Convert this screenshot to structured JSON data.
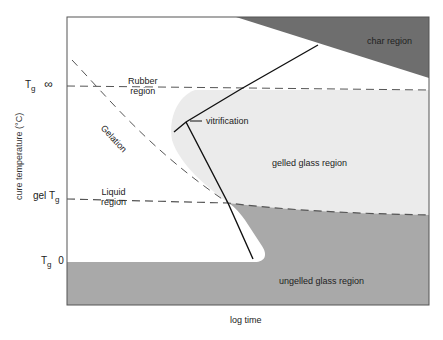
{
  "diagram": {
    "type": "TTT cure diagram",
    "axes": {
      "xlabel": "log time",
      "ylabel": "cure temperature (°C)",
      "y_ticks": [
        {
          "main": "T",
          "sub": "g",
          "suffix": "∞"
        },
        {
          "main": "gel T",
          "sub": "g",
          "suffix": ""
        },
        {
          "main": "T",
          "sub": "g",
          "suffix": "0"
        }
      ]
    },
    "regions": {
      "char": "char region",
      "rubber": "Rubber region",
      "rubber_line1": "Rubber",
      "rubber_line2": "region",
      "liquid_line1": "Liquid",
      "liquid_line2": "region",
      "gelled_glass": "gelled glass region",
      "ungelled_glass": "ungelled glass region"
    },
    "curves": {
      "gelation": "Gelation",
      "vitrification": "vitrification"
    },
    "colors": {
      "char": "#6e6e6e",
      "gelled_glass": "#ebebeb",
      "ungelled_glass": "#a9a9a9",
      "frame": "#444444",
      "curve": "#111111"
    }
  }
}
